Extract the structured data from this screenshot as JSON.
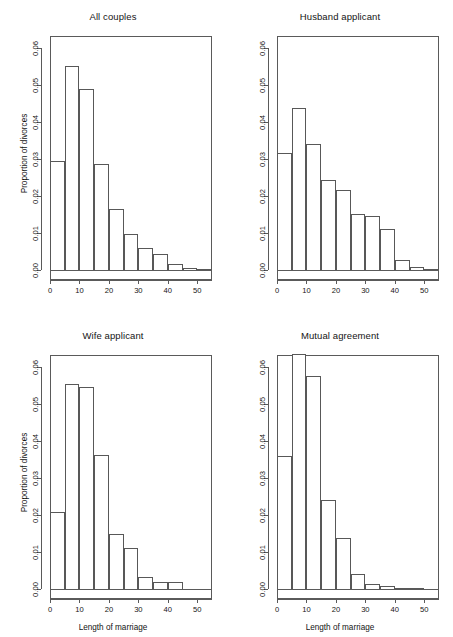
{
  "figure": {
    "layout": "2x2 panel histogram grid",
    "background": "#ffffff",
    "line_color": "#585858",
    "text_color": "#141414"
  },
  "axis": {
    "y_title": "Proportion of divorces",
    "x_title": "Length of marriage",
    "y_ticks": [
      "0.00",
      "0.01",
      "0.02",
      "0.03",
      "0.04",
      "0.05",
      "0.06"
    ],
    "x_ticks": [
      "0",
      "10",
      "20",
      "30",
      "40",
      "50"
    ]
  },
  "chart_data": [
    {
      "type": "bar",
      "title": "All couples",
      "xlabel": "Length of marriage",
      "ylabel": "Proportion of divorces",
      "xlim": [
        0,
        55
      ],
      "ylim": [
        0.0,
        0.063
      ],
      "grid": false,
      "legend": "none",
      "bin_width": 5,
      "bin_starts": [
        0,
        5,
        10,
        15,
        20,
        25,
        30,
        35,
        40,
        45,
        50
      ],
      "categories": [
        "0-5",
        "5-10",
        "10-15",
        "15-20",
        "20-25",
        "25-30",
        "30-35",
        "35-40",
        "40-45",
        "45-50",
        "50-55"
      ],
      "values": [
        0.0294,
        0.0552,
        0.0489,
        0.0285,
        0.0165,
        0.0098,
        0.006,
        0.0042,
        0.0017,
        0.0005,
        0.0002
      ]
    },
    {
      "type": "bar",
      "title": "Husband applicant",
      "xlabel": "Length of marriage",
      "ylabel": "Proportion of divorces",
      "xlim": [
        0,
        55
      ],
      "ylim": [
        0.0,
        0.063
      ],
      "grid": false,
      "legend": "none",
      "bin_width": 5,
      "bin_starts": [
        0,
        5,
        10,
        15,
        20,
        25,
        30,
        35,
        40,
        45,
        50
      ],
      "categories": [
        "0-5",
        "5-10",
        "10-15",
        "15-20",
        "20-25",
        "25-30",
        "30-35",
        "35-40",
        "40-45",
        "45-50",
        "50-55"
      ],
      "values": [
        0.0315,
        0.0437,
        0.0341,
        0.0244,
        0.0216,
        0.015,
        0.0146,
        0.0111,
        0.0028,
        0.0007,
        0.0003
      ]
    },
    {
      "type": "bar",
      "title": "Wife applicant",
      "xlabel": "Length of marriage",
      "ylabel": "Proportion of divorces",
      "xlim": [
        0,
        55
      ],
      "ylim": [
        0.0,
        0.063
      ],
      "grid": false,
      "legend": "none",
      "bin_width": 5,
      "bin_starts": [
        0,
        5,
        10,
        15,
        20,
        25,
        30,
        35,
        40
      ],
      "categories": [
        "0-5",
        "5-10",
        "10-15",
        "15-20",
        "20-25",
        "25-30",
        "30-35",
        "35-40",
        "40-45"
      ],
      "values": [
        0.0208,
        0.0553,
        0.0545,
        0.0362,
        0.0149,
        0.0111,
        0.0032,
        0.0019,
        0.0019
      ]
    },
    {
      "type": "bar",
      "title": "Mutual agreement",
      "xlabel": "Length of marriage",
      "ylabel": "Proportion of divorces",
      "xlim": [
        0,
        55
      ],
      "ylim": [
        0.0,
        0.063
      ],
      "grid": false,
      "legend": "none",
      "bin_width": 5,
      "bin_starts": [
        0,
        5,
        10,
        15,
        20,
        25,
        30,
        35,
        40,
        45
      ],
      "categories": [
        "0-5",
        "5-10",
        "10-15",
        "15-20",
        "20-25",
        "25-30",
        "30-35",
        "35-40",
        "40-45",
        "45-50"
      ],
      "values": [
        0.0358,
        0.0634,
        0.0576,
        0.0241,
        0.0138,
        0.0041,
        0.0014,
        0.0009,
        0.0,
        0.0003
      ]
    }
  ]
}
